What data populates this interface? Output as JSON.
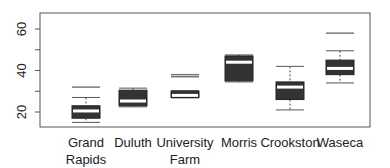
{
  "chart_data": {
    "type": "boxplot",
    "title": "",
    "xlabel": "",
    "ylabel": "",
    "ylim": [
      13,
      67
    ],
    "yticks": [
      20,
      40,
      60
    ],
    "minor_yticks": [
      30,
      50
    ],
    "grid": false,
    "categories": [
      "Grand\nRapids",
      "Duluth",
      "University\nFarm",
      "Morris",
      "Crookston",
      "Waseca"
    ],
    "category_labels": [
      [
        "Grand",
        "Rapids"
      ],
      [
        "Duluth"
      ],
      [
        "University",
        "Farm"
      ],
      [
        "Morris"
      ],
      [
        "Crookston"
      ],
      [
        "Waseca"
      ]
    ],
    "boxes": [
      {
        "name": "Grand Rapids",
        "whisker_low": 15,
        "q1": 17,
        "median": 20.5,
        "q3": 23,
        "whisker_high": 27,
        "outliers": [
          32
        ]
      },
      {
        "name": "Duluth",
        "whisker_low": 22.5,
        "q1": 23,
        "median": 25.3,
        "q3": 30.5,
        "whisker_high": 31.5,
        "outliers": []
      },
      {
        "name": "University Farm",
        "whisker_low": 26.8,
        "q1": 27,
        "median": 28,
        "q3": 30,
        "whisker_high": 30.3,
        "outliers": [
          37,
          38
        ]
      },
      {
        "name": "Morris",
        "whisker_low": 34.5,
        "q1": 35,
        "median": 44,
        "q3": 47,
        "whisker_high": 47.5,
        "outliers": []
      },
      {
        "name": "Crookston",
        "whisker_low": 21,
        "q1": 26,
        "median": 32,
        "q3": 34.5,
        "whisker_high": 42,
        "outliers": []
      },
      {
        "name": "Waseca",
        "whisker_low": 34,
        "q1": 38,
        "median": 41,
        "q3": 45,
        "whisker_high": 49.5,
        "outliers": [
          58
        ]
      }
    ],
    "box_fill": "#333333",
    "median_color": "#ffffff"
  }
}
